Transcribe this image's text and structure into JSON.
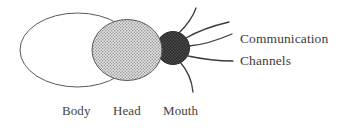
{
  "figure": {
    "type": "schematic-diagram",
    "background_color": "#ffffff"
  },
  "parts": {
    "body": {
      "label": "Body",
      "shape": "ellipse",
      "fill": "#ffffff",
      "stroke": "#555555"
    },
    "head": {
      "label": "Head",
      "shape": "ellipse",
      "fill": "#c9c9c9",
      "pattern": "stipple",
      "stroke": "#555555"
    },
    "mouth": {
      "label": "Mouth",
      "shape": "circle",
      "fill": "#3f3f3f",
      "pattern": "dense-stipple",
      "stroke": "#2b2b2b"
    }
  },
  "callout": {
    "line1": "Communication",
    "line2": "Channels",
    "color": "#3d3d3d"
  },
  "channels": {
    "count": 5,
    "stroke": "#3a3a3a",
    "items": [
      {
        "name": "channel-up-steep"
      },
      {
        "name": "channel-up-right"
      },
      {
        "name": "channel-right"
      },
      {
        "name": "channel-down-right"
      },
      {
        "name": "channel-down-steep"
      }
    ]
  }
}
